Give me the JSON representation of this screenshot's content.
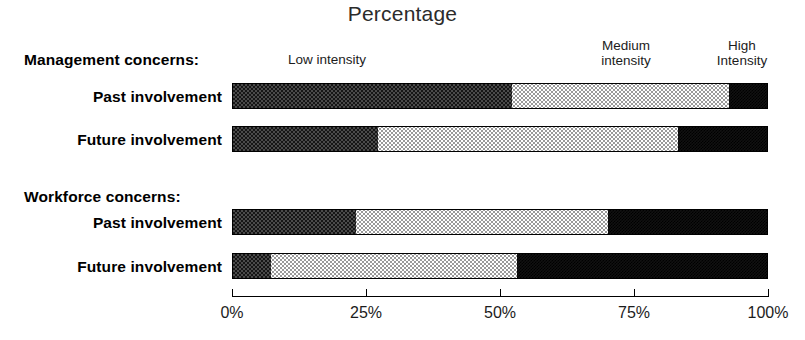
{
  "chart_data": {
    "type": "bar",
    "orientation": "horizontal",
    "stacked": true,
    "stacked_normalized": true,
    "title": "Percentage",
    "xlabel": "",
    "ylabel": "",
    "xlim": [
      0,
      100
    ],
    "xticks": [
      0,
      25,
      50,
      75,
      100
    ],
    "xticklabels": [
      "0%",
      "25%",
      "50%",
      "75%",
      "100%"
    ],
    "grid": false,
    "legend_position": "top",
    "series": [
      {
        "name": "Low intensity",
        "values": [
          52.0,
          27.0,
          23.0,
          7.0
        ]
      },
      {
        "name": "Medium intensity",
        "values": [
          40.5,
          56.0,
          47.0,
          46.0
        ]
      },
      {
        "name": "High intensity",
        "values": [
          7.5,
          17.0,
          30.0,
          47.0
        ]
      }
    ],
    "categories": [
      "Management concerns: Past involvement",
      "Management concerns: Future involvement",
      "Workforce concerns: Past involvement",
      "Workforce concerns: Future involvement"
    ],
    "groups": [
      {
        "heading": "Management concerns:",
        "rows": [
          {
            "label": "Past involvement",
            "low": 52.0,
            "medium": 40.5,
            "high": 7.5
          },
          {
            "label": "Future involvement",
            "low": 27.0,
            "medium": 56.0,
            "high": 17.0
          }
        ]
      },
      {
        "heading": "Workforce concerns:",
        "rows": [
          {
            "label": "Past involvement",
            "low": 23.0,
            "medium": 47.0,
            "high": 30.0
          },
          {
            "label": "Future involvement",
            "low": 7.0,
            "medium": 46.0,
            "high": 47.0
          }
        ]
      }
    ]
  },
  "legend": {
    "low": "Low intensity",
    "medium": "Medium\nintensity",
    "high": "High\nIntensity"
  },
  "colors": {
    "low": "#333333",
    "medium": "#e8e8e8",
    "high": "#111111",
    "axis": "#000000",
    "text": "#000000"
  }
}
